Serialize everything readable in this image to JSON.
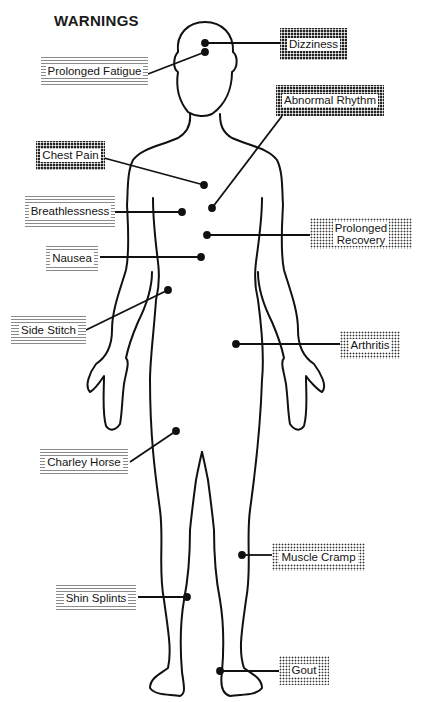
{
  "title": "WARNINGS",
  "labels": {
    "dizziness": "Dizziness",
    "prolonged_fatigue": "Prolonged Fatigue",
    "abnormal_rhythm": "Abnormal Rhythm",
    "chest_pain": "Chest Pain",
    "breathlessness": "Breathlessness",
    "prolonged_recovery_1": "Prolonged",
    "prolonged_recovery_2": "Recovery",
    "nausea": "Nausea",
    "side_stitch": "Side Stitch",
    "arthritis": "Arthritis",
    "charley_horse": "Charley Horse",
    "muscle_cramp": "Muscle Cramp",
    "shin_splints": "Shin Splints",
    "gout": "Gout"
  },
  "colors": {
    "ink": "#111111",
    "background": "#ffffff"
  }
}
